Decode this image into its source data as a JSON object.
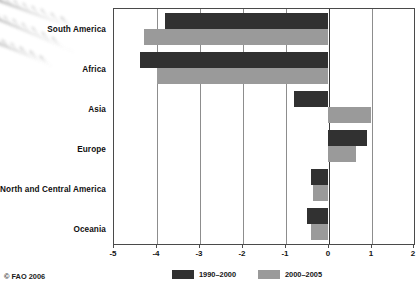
{
  "credit": "© FAO 2006",
  "legend": {
    "position": "bottom-center",
    "items": [
      {
        "label": "1990–2000",
        "color": "#313131",
        "swatch_name": "legend-swatch-1990-2000"
      },
      {
        "label": "2000–2005",
        "color": "#999999",
        "swatch_name": "legend-swatch-2000-2005"
      }
    ]
  },
  "axis": {
    "tick_labels": [
      "-5",
      "-4",
      "-3",
      "-2",
      "-1",
      "0",
      "1",
      "2"
    ]
  },
  "chart_data": {
    "type": "bar",
    "orientation": "horizontal",
    "title": "",
    "subtitle": "",
    "xlabel": "",
    "ylabel": "",
    "xlim": [
      -5,
      2
    ],
    "xticks": [
      -5,
      -4,
      -3,
      -2,
      -1,
      0,
      1,
      2
    ],
    "grid": true,
    "grid_axis": "x",
    "legend_position": "bottom-center",
    "categories": [
      "South America",
      "Africa",
      "Asia",
      "Europe",
      "North and Central America",
      "Oceania"
    ],
    "series": [
      {
        "name": "1990–2000",
        "color": "#313131",
        "values": [
          -3.8,
          -4.4,
          -0.8,
          0.9,
          -0.4,
          -0.5
        ]
      },
      {
        "name": "2000–2005",
        "color": "#999999",
        "values": [
          -4.3,
          -4.0,
          1.0,
          0.65,
          -0.35,
          -0.4
        ]
      }
    ]
  }
}
